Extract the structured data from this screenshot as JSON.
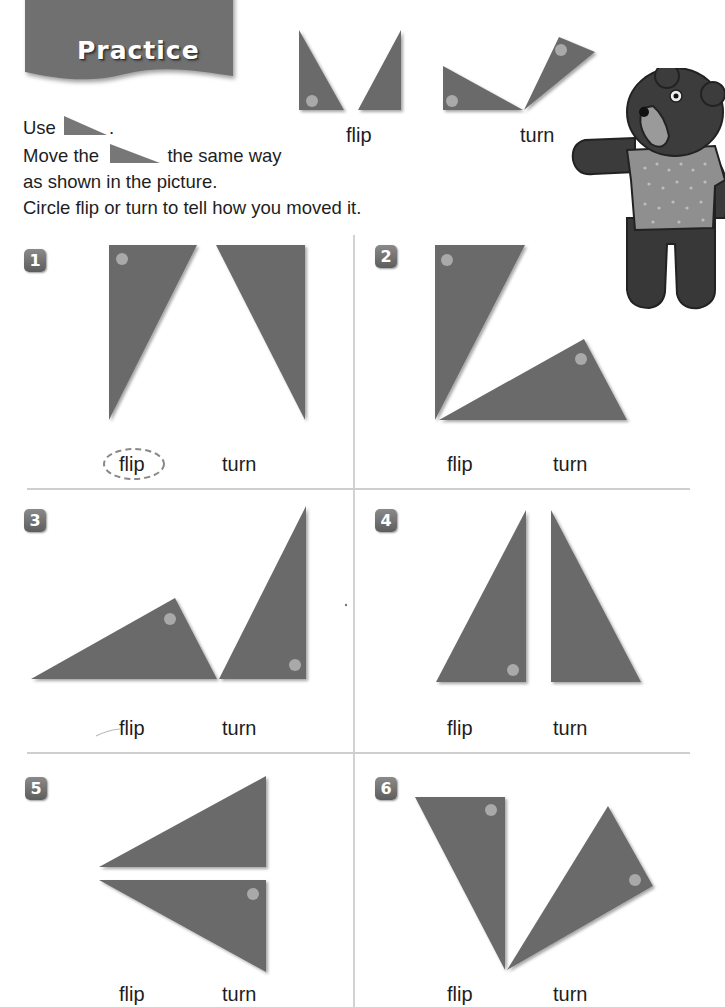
{
  "header": {
    "title": "Practice"
  },
  "instructions": {
    "line1_prefix": "Use",
    "line1_suffix": ".",
    "line2_prefix": "Move the",
    "line2_suffix": "the same way",
    "line3": "as shown in the picture.",
    "line4": "Circle flip or turn to tell how you moved it.",
    "shape_icon": "right-triangle-icon"
  },
  "examples": [
    {
      "label": "flip"
    },
    {
      "label": "turn"
    }
  ],
  "mascot": {
    "icon": "bear-illustration"
  },
  "colors": {
    "shape_fill": "#6b6b6b",
    "dot_fill": "#a9a9a9",
    "badge_fill": "#6e6e6e",
    "divider": "#cfcfcf",
    "text": "#1e1e1e"
  },
  "problems": [
    {
      "number": "1",
      "options": [
        "flip",
        "turn"
      ],
      "circled": "flip"
    },
    {
      "number": "2",
      "options": [
        "flip",
        "turn"
      ],
      "circled": null
    },
    {
      "number": "3",
      "options": [
        "flip",
        "turn"
      ],
      "circled": null
    },
    {
      "number": "4",
      "options": [
        "flip",
        "turn"
      ],
      "circled": null
    },
    {
      "number": "5",
      "options": [
        "flip",
        "turn"
      ],
      "circled": null
    },
    {
      "number": "6",
      "options": [
        "flip",
        "turn"
      ],
      "circled": null
    }
  ]
}
